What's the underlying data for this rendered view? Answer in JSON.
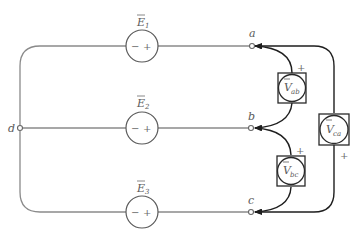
{
  "diagram": {
    "type": "three-phase wye source with voltmeters",
    "nodes": {
      "a": {
        "label": "a"
      },
      "b": {
        "label": "b"
      },
      "c": {
        "label": "c"
      },
      "d": {
        "label": "d"
      }
    },
    "sources": [
      {
        "id": "E1",
        "symbol": "E",
        "subscript": "1",
        "minus": "−",
        "plus": "+"
      },
      {
        "id": "E2",
        "symbol": "E",
        "subscript": "2",
        "minus": "−",
        "plus": "+"
      },
      {
        "id": "E3",
        "symbol": "E",
        "subscript": "3",
        "minus": "−",
        "plus": "+"
      }
    ],
    "meters": [
      {
        "id": "Vab",
        "symbol": "V",
        "subscript": "ab",
        "polarity": "+"
      },
      {
        "id": "Vbc",
        "symbol": "V",
        "subscript": "bc",
        "polarity": "+"
      },
      {
        "id": "Vca",
        "symbol": "V",
        "subscript": "ca",
        "polarity": "+"
      }
    ],
    "colors": {
      "wire": "#8a8a8a",
      "meter_lead": "#1e1e1e",
      "label": "#5a5a5a"
    }
  }
}
